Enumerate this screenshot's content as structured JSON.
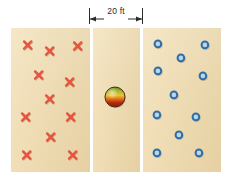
{
  "figure": {
    "background_color": "#ffffff",
    "panel_color": "#f0dcb0",
    "dimension": {
      "label": "20 ft",
      "line_color": "#2b2b2b",
      "arrow_left_name": "arrow-left",
      "arrow_right_name": "arrow-right"
    },
    "panels": [
      {
        "id": "left",
        "name": "left-region",
        "x": 11,
        "y": 28,
        "width": 79,
        "height": 144
      },
      {
        "id": "mid",
        "name": "middle-region",
        "x": 93,
        "y": 28,
        "width": 47,
        "height": 144
      },
      {
        "id": "right",
        "name": "right-region",
        "x": 143,
        "y": 28,
        "width": 78,
        "height": 144
      }
    ],
    "left_marks": {
      "symbol": "x-mark",
      "color": "#e8543f",
      "count": 10,
      "points": [
        {
          "x": 28,
          "y": 45
        },
        {
          "x": 50,
          "y": 51
        },
        {
          "x": 78,
          "y": 46
        },
        {
          "x": 39,
          "y": 75
        },
        {
          "x": 70,
          "y": 82
        },
        {
          "x": 50,
          "y": 99
        },
        {
          "x": 26,
          "y": 117
        },
        {
          "x": 71,
          "y": 117
        },
        {
          "x": 51,
          "y": 137
        },
        {
          "x": 27,
          "y": 155
        },
        {
          "x": 73,
          "y": 155
        }
      ]
    },
    "right_marks": {
      "symbol": "ring-circle",
      "ring_color": "#2f6fa8",
      "fill_color": "#bcd6e8",
      "count": 12,
      "points": [
        {
          "x": 158,
          "y": 44
        },
        {
          "x": 205,
          "y": 45
        },
        {
          "x": 181,
          "y": 58
        },
        {
          "x": 158,
          "y": 71
        },
        {
          "x": 203,
          "y": 76
        },
        {
          "x": 174,
          "y": 95
        },
        {
          "x": 157,
          "y": 115
        },
        {
          "x": 196,
          "y": 117
        },
        {
          "x": 179,
          "y": 135
        },
        {
          "x": 157,
          "y": 153
        },
        {
          "x": 199,
          "y": 153
        }
      ]
    },
    "center_object": {
      "name": "sphere",
      "x": 115,
      "y": 97,
      "radius": 10,
      "top_color": "#5f8f1f",
      "mid_color": "#f0c03a",
      "bottom_color": "#8b1a0c"
    }
  }
}
